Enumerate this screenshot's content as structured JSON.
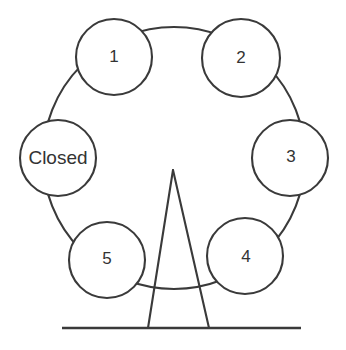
{
  "figure": {
    "kind": "ferris-wheel-diagram",
    "title": "Ferris wheel with numbered cabins",
    "stroke_color": "#3a3a3a",
    "text_color": "#333333",
    "background_color": "#ffffff",
    "canvas": {
      "width": 346,
      "height": 350
    }
  },
  "wheel": {
    "center_x": 174,
    "center_y": 158,
    "radius": 131,
    "hub_apex_x": 173,
    "hub_apex_y": 170
  },
  "cabins": [
    {
      "id": "cabin-1",
      "label": "1",
      "type": "number",
      "cx": 114,
      "cy": 57,
      "r": 38,
      "label_x": 114,
      "label_y": 57
    },
    {
      "id": "cabin-2",
      "label": "2",
      "type": "number",
      "cx": 241,
      "cy": 58,
      "r": 39,
      "label_x": 241,
      "label_y": 58
    },
    {
      "id": "cabin-3",
      "label": "3",
      "type": "number",
      "cx": 290,
      "cy": 158,
      "r": 38,
      "label_x": 291,
      "label_y": 157
    },
    {
      "id": "cabin-4",
      "label": "4",
      "type": "number",
      "cx": 245,
      "cy": 256,
      "r": 38,
      "label_x": 246,
      "label_y": 257
    },
    {
      "id": "cabin-5",
      "label": "5",
      "type": "number",
      "cx": 107,
      "cy": 260,
      "r": 38,
      "label_x": 107,
      "label_y": 259
    },
    {
      "id": "cabin-closed",
      "label": "Closed",
      "type": "text",
      "cx": 58,
      "cy": 158,
      "r": 38,
      "label_x": 58,
      "label_y": 158
    }
  ],
  "support": {
    "name": "triangular-support-stand",
    "apex_x": 173,
    "apex_y": 170,
    "left_foot_x": 148,
    "right_foot_x": 209,
    "foot_y": 328
  },
  "ground": {
    "name": "ground-line",
    "x1": 62,
    "x2": 301,
    "y": 328
  }
}
